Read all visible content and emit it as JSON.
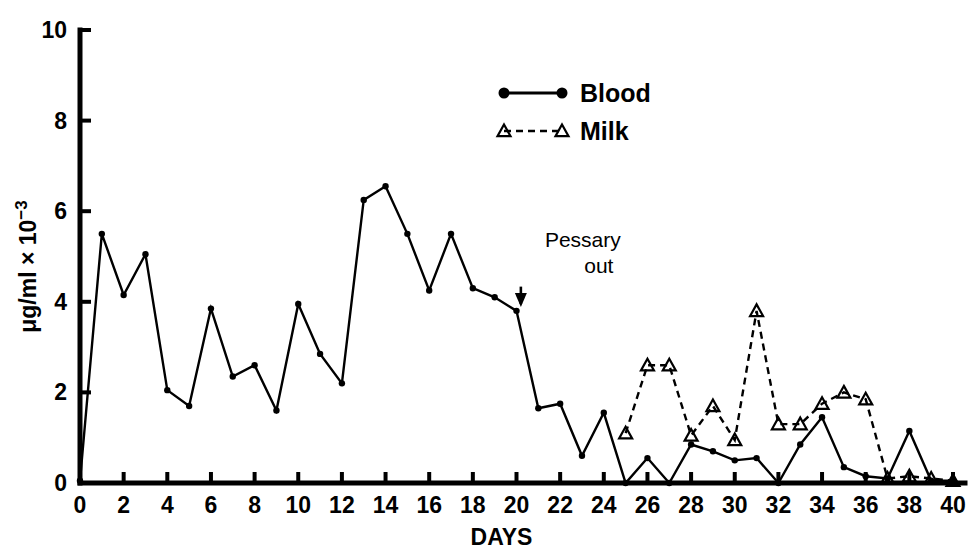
{
  "chart_data": {
    "type": "line",
    "title": "",
    "xlabel": "DAYS",
    "ylabel": "μg/ml × 10⁻³",
    "ylabel_parts": {
      "base": "μg/ml × 10",
      "exponent": "−3"
    },
    "xlim": [
      0,
      40
    ],
    "ylim": [
      0,
      10
    ],
    "xticks": [
      0,
      2,
      4,
      6,
      8,
      10,
      12,
      14,
      16,
      18,
      20,
      22,
      24,
      26,
      28,
      30,
      32,
      34,
      36,
      38,
      40
    ],
    "xticklabels": [
      "0",
      "2",
      "4",
      "6",
      "8",
      "10",
      "12",
      "14",
      "16",
      "18",
      "20",
      "22",
      "24",
      "26",
      "28",
      "30",
      "32",
      "34",
      "36",
      "38",
      "40"
    ],
    "yticks": [
      0,
      2,
      4,
      6,
      8,
      10
    ],
    "yticklabels": [
      "0",
      "2",
      "4",
      "6",
      "8",
      "10"
    ],
    "grid": false,
    "legend_position": "upper-center",
    "series": [
      {
        "name": "Blood",
        "marker": "filled-circle",
        "linestyle": "solid",
        "color": "#000000",
        "x": [
          0,
          1,
          2,
          3,
          4,
          5,
          6,
          7,
          8,
          9,
          10,
          11,
          12,
          13,
          14,
          15,
          16,
          17,
          18,
          19,
          20,
          21,
          22,
          23,
          24,
          25,
          26,
          27,
          28,
          29,
          30,
          31,
          32,
          33,
          34,
          35,
          36,
          37,
          38,
          39,
          40
        ],
        "values": [
          0.05,
          5.5,
          4.15,
          5.05,
          2.05,
          1.7,
          3.85,
          2.35,
          2.6,
          1.6,
          3.95,
          2.85,
          2.2,
          6.25,
          6.55,
          5.5,
          4.25,
          5.5,
          4.3,
          4.1,
          3.8,
          1.65,
          1.75,
          0.6,
          1.55,
          0.0,
          0.55,
          0.0,
          0.85,
          0.7,
          0.5,
          0.55,
          0.0,
          0.85,
          1.45,
          0.35,
          0.15,
          0.1,
          1.15,
          0.05,
          0.05
        ]
      },
      {
        "name": "Milk",
        "marker": "open-triangle",
        "linestyle": "dashed",
        "color": "#000000",
        "x": [
          25,
          26,
          27,
          28,
          29,
          30,
          31,
          32,
          33,
          34,
          35,
          36,
          37,
          38,
          39,
          40
        ],
        "values": [
          1.1,
          2.6,
          2.6,
          1.05,
          1.7,
          0.95,
          3.8,
          1.3,
          1.3,
          1.75,
          2.0,
          1.85,
          0.1,
          0.15,
          0.1,
          0.05
        ]
      }
    ],
    "annotations": [
      {
        "name": "pessary-out",
        "text_line1": "Pessary",
        "text_line2": "out",
        "x": 20.2,
        "y_top": 4.6,
        "y_bottom": 3.95
      }
    ]
  },
  "legend": {
    "items": [
      {
        "label": "Blood",
        "marker": "filled-circle",
        "linestyle": "solid"
      },
      {
        "label": "Milk",
        "marker": "open-triangle",
        "linestyle": "dashed"
      }
    ]
  }
}
